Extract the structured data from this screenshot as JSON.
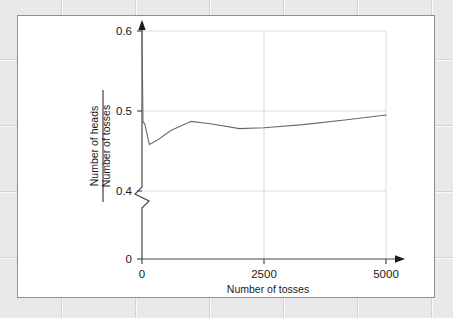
{
  "figure": {
    "panel_name": "coin-toss-proportion-figure",
    "background_color": "#ffffff",
    "border_color": "#8f8f8f",
    "page_background_color": "#e9e9e9"
  },
  "chart_data": {
    "type": "line",
    "title": "",
    "xlabel": "Number of tosses",
    "ylabel_numerator": "Number of heads",
    "ylabel_denominator": "Number of tosses",
    "ylabel": "Number of heads / Number of tosses",
    "xlim": [
      0,
      5000
    ],
    "ylim": [
      0.4,
      0.6
    ],
    "y_axis_origin_label": "0",
    "y_axis_break": true,
    "y_axis_break_note": "zigzag break between 0 and 0.4",
    "xticks": [
      0,
      2500,
      5000
    ],
    "xtick_labels": [
      "0",
      "2500",
      "5000"
    ],
    "yticks": [
      0.4,
      0.5,
      0.6
    ],
    "ytick_labels": [
      "0.4",
      "0.5",
      "0.6"
    ],
    "grid": true,
    "grid_color": "#d9d9d9",
    "legend": "none",
    "line_color": "#5a5a5a",
    "axis_color": "#4a4a4a",
    "x": [
      0,
      20,
      60,
      150,
      300,
      600,
      1000,
      1400,
      2000,
      2500,
      3300,
      4200,
      5000
    ],
    "y": [
      0.6,
      0.487,
      0.483,
      0.458,
      0.463,
      0.476,
      0.487,
      0.484,
      0.478,
      0.479,
      0.483,
      0.489,
      0.495
    ],
    "values": [
      0.6,
      0.487,
      0.483,
      0.458,
      0.463,
      0.476,
      0.487,
      0.484,
      0.478,
      0.479,
      0.483,
      0.489,
      0.495
    ],
    "series": [
      {
        "name": "proportion of heads",
        "values": [
          0.6,
          0.487,
          0.483,
          0.458,
          0.463,
          0.476,
          0.487,
          0.484,
          0.478,
          0.479,
          0.483,
          0.489,
          0.495
        ]
      }
    ]
  }
}
